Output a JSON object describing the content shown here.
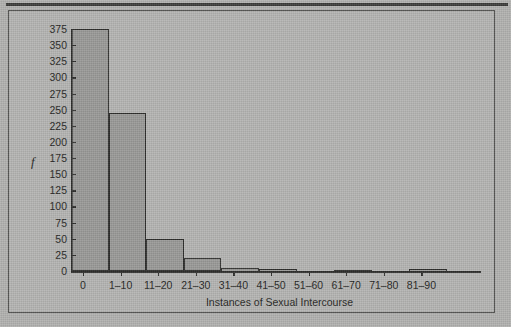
{
  "figure": {
    "background_color": "#b0b0ae",
    "ink_color": "#2b2b29",
    "bar_fill": "#989896"
  },
  "chart_data": {
    "type": "bar",
    "title": "",
    "xlabel": "Instances of Sexual Intercourse",
    "ylabel": "f",
    "categories": [
      "0",
      "1–10",
      "11–20",
      "21–30",
      "31–40",
      "41–50",
      "51–60",
      "61–70",
      "71–80",
      "81–90"
    ],
    "values": [
      375,
      245,
      50,
      20,
      5,
      3,
      0,
      2,
      0,
      3
    ],
    "ylim": [
      0,
      375
    ],
    "ytick_labels": [
      "0",
      "25",
      "50",
      "75",
      "100",
      "125",
      "150",
      "175",
      "200",
      "225",
      "250",
      "275",
      "300",
      "325",
      "350",
      "375"
    ],
    "ytick_values": [
      0,
      25,
      50,
      75,
      100,
      125,
      150,
      175,
      200,
      225,
      250,
      275,
      300,
      325,
      350,
      375
    ],
    "grid": false,
    "legend": null
  }
}
